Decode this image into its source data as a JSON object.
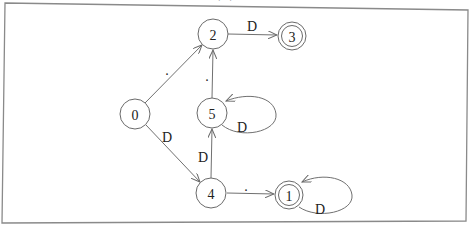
{
  "caption": {
    "text": "(...)",
    "note": "partially cut off at top edge"
  },
  "diagram": {
    "type": "finite-state-automaton",
    "colors": {
      "stroke": "#6a6a6a",
      "frame": "#8a8a8a",
      "text": "#222222",
      "background": "#ffffff"
    },
    "states": [
      {
        "id": "0",
        "label": "0",
        "accepting": false,
        "x": 135,
        "y": 114
      },
      {
        "id": "1",
        "label": "1",
        "accepting": true,
        "x": 289,
        "y": 195
      },
      {
        "id": "2",
        "label": "2",
        "accepting": false,
        "x": 213,
        "y": 34
      },
      {
        "id": "3",
        "label": "3",
        "accepting": true,
        "x": 292,
        "y": 36
      },
      {
        "id": "4",
        "label": "4",
        "accepting": false,
        "x": 211,
        "y": 193
      },
      {
        "id": "5",
        "label": "5",
        "accepting": false,
        "x": 212,
        "y": 113
      }
    ],
    "transitions": [
      {
        "from": "0",
        "to": "2",
        "label": "."
      },
      {
        "from": "0",
        "to": "4",
        "label": "D"
      },
      {
        "from": "2",
        "to": "3",
        "label": "D"
      },
      {
        "from": "5",
        "to": "2",
        "label": "."
      },
      {
        "from": "5",
        "to": "5",
        "label": "D"
      },
      {
        "from": "4",
        "to": "5",
        "label": "D"
      },
      {
        "from": "4",
        "to": "1",
        "label": "."
      },
      {
        "from": "1",
        "to": "1",
        "label": "D"
      }
    ]
  }
}
